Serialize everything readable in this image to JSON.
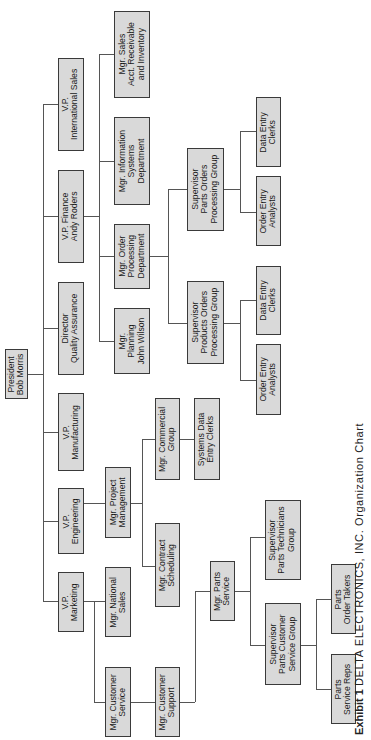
{
  "orientation": "rotated 90 degrees counter-clockwise",
  "caption": {
    "label": "Exhibit 1",
    "text": "DELTA ELECTRONICS, INC. Organization Chart"
  },
  "colors": {
    "box_fill": "#d9d9d9",
    "box_border": "#3a3a3a",
    "connector": "#555555"
  },
  "nodes": {
    "president": "President\nBob Morris",
    "vp_intl_sales": "V.P.\nInternational Sales",
    "vp_finance": "V.P. Finance\nAndy Roders",
    "dir_qa": "Director\nQuality Assurance",
    "vp_manufacturing": "V.P.\nManufacturing",
    "vp_engineering": "V.P.\nEngineering",
    "vp_marketing": "V.P.\nMarketing",
    "mgr_sales_acct": "Mgr. Sales\nAcct. Receivable\nand Inventory",
    "mgr_info_systems": "Mgr. Information\nSystems\nDepartment",
    "mgr_order_processing": "Mgr. Order\nProcessing\nDepartment",
    "mgr_planning": "Mgr.\nPlanning\nJohn Wilson",
    "sup_parts_orders": "Supervisor\nParts Orders\nProcessing Group",
    "sup_products_orders": "Supervisor\nProducts Orders\nProcessing Group",
    "parts_data_entry": "Data Entry\nClerks",
    "parts_order_entry": "Order Entry\nAnalysts",
    "products_data_entry": "Data Entry\nClerks",
    "products_order_entry": "Order Entry\nAnalysts",
    "mgr_project_mgmt": "Mgr. Project\nManagement",
    "mgr_commercial": "Mgr. Commercial\nGroup",
    "systems_data_entry": "Systems Data\nEntry Clerks",
    "mgr_contract_scheduling": "Mgr. Contract\nScheduling",
    "mgr_national_sales": "Mgr. National\nSales",
    "mgr_customer_service": "Mgr. Customer\nService",
    "mgr_customer_support": "Mgr. Customer\nSupport",
    "mgr_parts_service": "Mgr. Parts\nService",
    "sup_parts_technicians": "Supervisor\nParts Technicians\nGroup",
    "sup_parts_customer_service": "Supervisor\nParts Customer\nService Group",
    "parts_order_takers": "Parts\nOrder Takers",
    "parts_service_reps": "Parts\nService Reps"
  },
  "hierarchy": {
    "President Bob Morris": {
      "V.P. International Sales": {},
      "V.P. Finance Andy Roders": {
        "Mgr. Sales Acct. Receivable and Inventory": {},
        "Mgr. Information Systems Department": {},
        "Mgr. Order Processing Department": {
          "Supervisor Parts Orders Processing Group": [
            "Data Entry Clerks",
            "Order Entry Analysts"
          ],
          "Supervisor Products Orders Processing Group": [
            "Data Entry Clerks",
            "Order Entry Analysts"
          ]
        },
        "Mgr. Planning John Wilson": {}
      },
      "Director Quality Assurance": {},
      "V.P. Manufacturing": {},
      "V.P. Engineering": {
        "Mgr. Project Management": {
          "Mgr. Commercial Group": [
            "Systems Data Entry Clerks"
          ],
          "Mgr. Contract Scheduling": []
        }
      },
      "V.P. Marketing": {
        "Mgr. National Sales": {},
        "Mgr. Customer Service": {
          "Mgr. Customer Support": {
            "Mgr. Parts Service": {
              "Supervisor Parts Technicians Group": [],
              "Supervisor Parts Customer Service Group": [
                "Parts Order Takers",
                "Parts Service Reps"
              ]
            }
          }
        }
      }
    }
  }
}
